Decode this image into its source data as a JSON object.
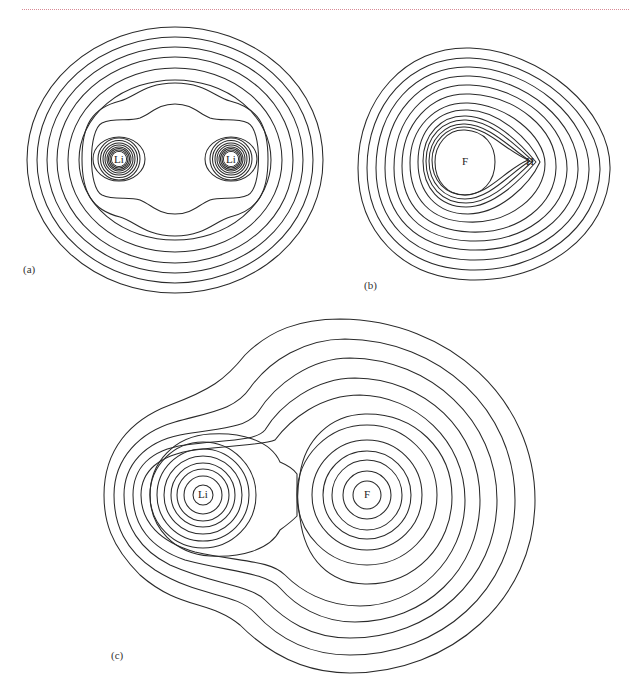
{
  "header": {
    "rule_color": "#d98a96"
  },
  "panels": [
    {
      "id": "a",
      "label": "(a)",
      "molecule": "Li2",
      "atoms": [
        {
          "symbol": "Li",
          "x": 119,
          "y": 159
        },
        {
          "symbol": "Li",
          "x": 231,
          "y": 159
        }
      ]
    },
    {
      "id": "b",
      "label": "(b)",
      "molecule": "HF",
      "atoms": [
        {
          "symbol": "F",
          "x": 465,
          "y": 162
        },
        {
          "symbol": "H",
          "x": 530,
          "y": 162
        }
      ]
    },
    {
      "id": "c",
      "label": "(c)",
      "molecule": "LiF",
      "atoms": [
        {
          "symbol": "Li",
          "x": 203,
          "y": 495
        },
        {
          "symbol": "F",
          "x": 367,
          "y": 495
        }
      ]
    }
  ],
  "colors": {
    "contour": "#2a2a2a",
    "background": "#ffffff"
  }
}
